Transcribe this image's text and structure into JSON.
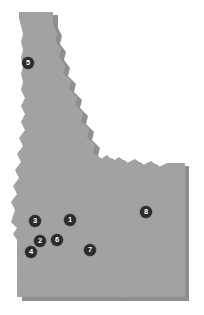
{
  "figure": {
    "region_name": "Idaho",
    "background_color": "#ffffff",
    "land_fill_color": "#a8a8a8",
    "land_shadow_color": "#8f8f8f",
    "marker_fill_color": "#2b2b2b",
    "marker_text_color": "#ffffff",
    "marker_count": 8
  },
  "markers": [
    {
      "id": "marker-1",
      "label": "1",
      "x": 70,
      "y": 220
    },
    {
      "id": "marker-2",
      "label": "2",
      "x": 40,
      "y": 241
    },
    {
      "id": "marker-3",
      "label": "3",
      "x": 35,
      "y": 221
    },
    {
      "id": "marker-4",
      "label": "4",
      "x": 31,
      "y": 252
    },
    {
      "id": "marker-5",
      "label": "5",
      "x": 28,
      "y": 63
    },
    {
      "id": "marker-6",
      "label": "6",
      "x": 57,
      "y": 240
    },
    {
      "id": "marker-7",
      "label": "7",
      "x": 90,
      "y": 250
    },
    {
      "id": "marker-8",
      "label": "8",
      "x": 146,
      "y": 212
    }
  ]
}
